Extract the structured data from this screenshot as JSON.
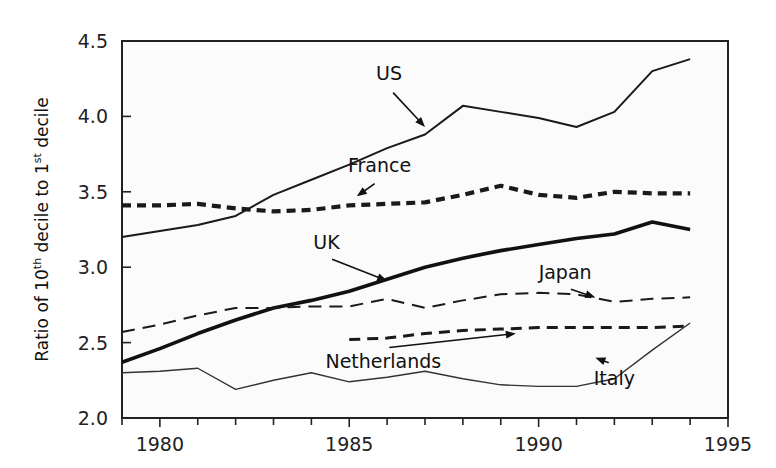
{
  "chart_data": {
    "type": "line",
    "title": "",
    "xlabel": "",
    "ylabel": "Ratio of 10th decile to 1st decile",
    "ylabel_parts": {
      "lead": "Ratio of 10",
      "sup1": "th",
      "mid": " decile to 1",
      "sup2": "st",
      "tail": " decile"
    },
    "xlim": [
      1979,
      1995
    ],
    "ylim": [
      2.0,
      4.5
    ],
    "x_ticks_major": [
      1980,
      1985,
      1990,
      1995
    ],
    "x_ticks_minor": [
      1979,
      1980,
      1981,
      1982,
      1983,
      1984,
      1985,
      1986,
      1987,
      1988,
      1989,
      1990,
      1991,
      1992,
      1993,
      1994,
      1995
    ],
    "y_ticks": [
      2.0,
      2.5,
      3.0,
      3.5,
      4.0,
      4.5
    ],
    "y_tick_labels": [
      "2.0",
      "2.5",
      "3.0",
      "3.5",
      "4.0",
      "4.5"
    ],
    "x_tick_labels": [
      "1980",
      "1985",
      "1990",
      "1995"
    ],
    "grid": false,
    "legend_position": "inline-annotations",
    "series": [
      {
        "name": "US",
        "style": "solid-thin",
        "color": "#1a1a1a",
        "x": [
          1979,
          1980,
          1981,
          1982,
          1983,
          1984,
          1985,
          1986,
          1987,
          1988,
          1989,
          1990,
          1991,
          1992,
          1993,
          1994
        ],
        "values": [
          3.2,
          3.24,
          3.28,
          3.34,
          3.48,
          3.58,
          3.68,
          3.79,
          3.88,
          4.07,
          4.03,
          3.99,
          3.93,
          4.03,
          4.3,
          4.38
        ]
      },
      {
        "name": "France",
        "style": "dashed-thick",
        "color": "#1a1a1a",
        "x": [
          1979,
          1980,
          1981,
          1982,
          1983,
          1984,
          1985,
          1986,
          1987,
          1988,
          1989,
          1990,
          1991,
          1992,
          1993,
          1994
        ],
        "values": [
          3.41,
          3.41,
          3.42,
          3.39,
          3.37,
          3.38,
          3.41,
          3.42,
          3.43,
          3.48,
          3.54,
          3.48,
          3.46,
          3.5,
          3.49,
          3.49
        ]
      },
      {
        "name": "UK",
        "style": "solid-thick",
        "color": "#111111",
        "x": [
          1979,
          1980,
          1981,
          1982,
          1983,
          1984,
          1985,
          1986,
          1987,
          1988,
          1989,
          1990,
          1991,
          1992,
          1993,
          1994
        ],
        "values": [
          2.37,
          2.46,
          2.56,
          2.65,
          2.73,
          2.78,
          2.84,
          2.92,
          3.0,
          3.06,
          3.11,
          3.15,
          3.19,
          3.22,
          3.3,
          3.25
        ]
      },
      {
        "name": "Japan",
        "style": "dashed-long",
        "color": "#1a1a1a",
        "x": [
          1979,
          1980,
          1981,
          1982,
          1983,
          1984,
          1985,
          1986,
          1987,
          1988,
          1989,
          1990,
          1991,
          1992,
          1993,
          1994
        ],
        "values": [
          2.57,
          2.62,
          2.68,
          2.73,
          2.73,
          2.74,
          2.74,
          2.79,
          2.73,
          2.78,
          2.82,
          2.83,
          2.82,
          2.77,
          2.79,
          2.8
        ]
      },
      {
        "name": "Netherlands",
        "style": "dashed-medium",
        "color": "#1a1a1a",
        "x": [
          1985,
          1986,
          1987,
          1988,
          1989,
          1990,
          1991,
          1992,
          1993,
          1994
        ],
        "values": [
          2.52,
          2.53,
          2.56,
          2.58,
          2.59,
          2.6,
          2.6,
          2.6,
          2.6,
          2.61
        ]
      },
      {
        "name": "Italy",
        "style": "solid-hairline",
        "color": "#333333",
        "x": [
          1979,
          1980,
          1981,
          1982,
          1983,
          1984,
          1985,
          1986,
          1987,
          1988,
          1989,
          1990,
          1991,
          1992,
          1993,
          1994
        ],
        "values": [
          2.3,
          2.31,
          2.33,
          2.19,
          2.25,
          2.3,
          2.24,
          2.27,
          2.31,
          2.26,
          2.22,
          2.21,
          2.21,
          2.26,
          2.45,
          2.63
        ]
      }
    ],
    "annotations": [
      {
        "label": "US",
        "text_x": 1986.05,
        "text_y": 4.24,
        "tip_x": 1987.0,
        "tip_y": 3.93
      },
      {
        "label": "France",
        "text_x": 1985.8,
        "text_y": 3.63,
        "tip_x": 1985.2,
        "tip_y": 3.47
      },
      {
        "label": "UK",
        "text_x": 1984.4,
        "text_y": 3.12,
        "tip_x": 1986.0,
        "tip_y": 2.91
      },
      {
        "label": "Japan",
        "text_x": 1990.7,
        "text_y": 2.92,
        "tip_x": 1991.5,
        "tip_y": 2.8
      },
      {
        "label": "Netherlands",
        "text_x": 1985.9,
        "text_y": 2.33,
        "tip_x": 1989.4,
        "tip_y": 2.56
      },
      {
        "label": "Italy",
        "text_x": 1992.0,
        "text_y": 2.22,
        "tip_x": 1991.5,
        "tip_y": 2.4
      }
    ]
  }
}
